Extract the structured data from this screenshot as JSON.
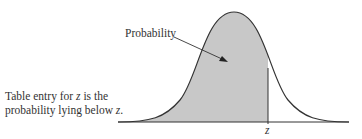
{
  "diagram": {
    "type": "normal-distribution-shaded-left-tail",
    "caption": {
      "line1_pre": "Table entry for ",
      "line1_var": "z",
      "line1_post": " is the",
      "line2_pre": "probability lying below ",
      "line2_var": "z",
      "line2_post": "."
    },
    "probability_label": "Probability",
    "z_label": "z",
    "colors": {
      "shade": "#c8c8c8",
      "curve": "#333333",
      "background": "#ffffff"
    }
  }
}
